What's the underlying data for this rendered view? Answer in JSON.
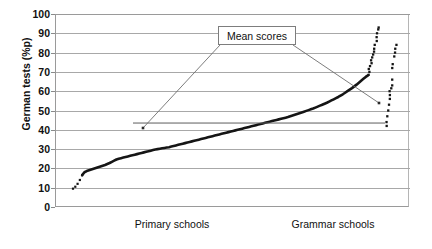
{
  "chart_data": {
    "type": "scatter",
    "title": "",
    "xlabel": "",
    "ylabel": "German tests (%p)",
    "ylim": [
      0,
      100
    ],
    "yticks": [
      0,
      10,
      20,
      30,
      40,
      50,
      60,
      70,
      80,
      90,
      100
    ],
    "grid": true,
    "legend_position": "none",
    "x_categories": [
      "Primary schools",
      "Grammar schools"
    ],
    "annotations": [
      {
        "text": "Mean scores",
        "points_to": [
          "primary-mean-line-left-end",
          "grammar-lower-cluster"
        ]
      }
    ],
    "series": [
      {
        "name": "Primary schools ranked mean scores",
        "style": "dotted-start-then-thick-line",
        "note": "Rank-ordered school mean scores rising monotonically",
        "values": [
          9.5,
          10.5,
          12.0,
          14.0,
          16.5,
          18.0,
          18.6,
          19.0,
          19.4,
          19.8,
          20.2,
          20.6,
          21.0,
          21.4,
          21.8,
          22.3,
          22.8,
          23.4,
          24.0,
          24.6,
          25.0,
          25.3,
          25.6,
          25.9,
          26.2,
          26.5,
          26.8,
          27.1,
          27.4,
          27.7,
          28.0,
          28.3,
          28.6,
          28.9,
          29.2,
          29.5,
          29.8,
          30.0,
          30.2,
          30.4,
          30.6,
          30.8,
          31.0,
          31.3,
          31.6,
          31.9,
          32.2,
          32.5,
          32.8,
          33.1,
          33.4,
          33.7,
          34.0,
          34.3,
          34.6,
          34.9,
          35.2,
          35.5,
          35.8,
          36.1,
          36.4,
          36.7,
          37.0,
          37.3,
          37.6,
          37.9,
          38.2,
          38.5,
          38.8,
          39.1,
          39.4,
          39.7,
          40.0,
          40.3,
          40.6,
          40.9,
          41.2,
          41.5,
          41.8,
          42.1,
          42.4,
          42.7,
          43.0,
          43.3,
          43.6,
          43.9,
          44.2,
          44.5,
          44.8,
          45.1,
          45.4,
          45.7,
          46.0,
          46.3,
          46.6,
          47.0,
          47.4,
          47.8,
          48.2,
          48.6,
          49.0,
          49.4,
          49.8,
          50.2,
          50.6,
          51.0,
          51.5,
          52.0,
          52.5,
          53.0,
          53.5,
          54.0,
          54.6,
          55.2,
          55.8,
          56.4,
          57.0,
          57.7,
          58.4,
          59.2,
          60.0,
          60.8,
          61.6,
          62.5,
          63.4,
          64.4,
          65.4,
          66.4,
          67.4,
          68.2
        ]
      },
      {
        "name": "Grammar schools upper cluster",
        "style": "dotted",
        "values": [
          68.5,
          70.0,
          71.5,
          73.0,
          74.5,
          76.0,
          77.5,
          79.0,
          80.5,
          82.0,
          84.0,
          86.0,
          88.0,
          90.0,
          92.0,
          93.0
        ]
      },
      {
        "name": "Grammar schools second cluster",
        "style": "dotted",
        "values": [
          42.0,
          44.0,
          47.0,
          50.0,
          53.0,
          56.0,
          58.0,
          60.0,
          61.5,
          63.0,
          66.0,
          72.0,
          74.0,
          78.0,
          80.0,
          82.0,
          84.0
        ]
      }
    ],
    "mean_line": {
      "label": "Mean scores",
      "value": 43.5,
      "x_start_px": 133,
      "x_end_px": 385
    }
  },
  "axis": {
    "y_title": "German tests (%p)",
    "ticks": [
      "100",
      "90",
      "80",
      "70",
      "60",
      "50",
      "40",
      "30",
      "20",
      "10",
      "0"
    ]
  },
  "xaxis": {
    "labels": [
      {
        "text": "Primary schools"
      },
      {
        "text": "Grammar schools"
      }
    ]
  },
  "callout": {
    "label": "Mean scores"
  }
}
